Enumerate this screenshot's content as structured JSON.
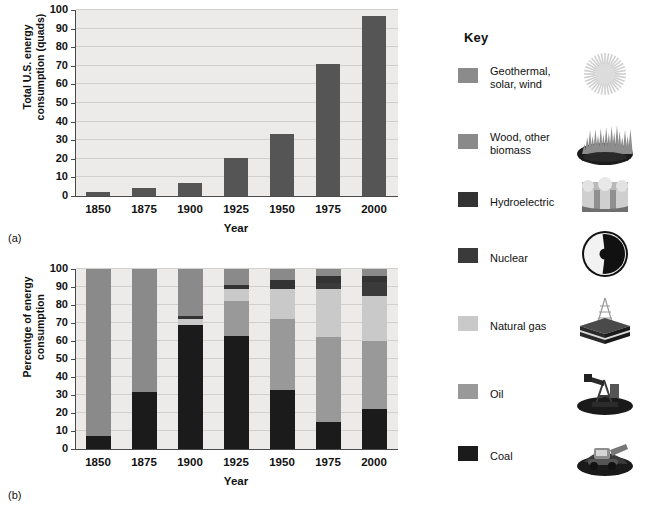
{
  "figure": {
    "panel_a_caption": "(a)",
    "panel_b_caption": "(b)"
  },
  "key": {
    "title": "Key",
    "items": [
      {
        "label": "Geothermal,\nsolar, wind",
        "color": "#8b8b8b",
        "icon": "sun-icon"
      },
      {
        "label": "Wood, other\nbiomass",
        "color": "#8a8a8a",
        "icon": "biomass-icon"
      },
      {
        "label": "Hydroelectric",
        "color": "#333333",
        "icon": "dam-icon"
      },
      {
        "label": "Nuclear",
        "color": "#3a3a3a",
        "icon": "radiation-icon"
      },
      {
        "label": "Natural gas",
        "color": "#c9c9c9",
        "icon": "gas-rig-icon"
      },
      {
        "label": "Oil",
        "color": "#999999",
        "icon": "oil-pump-icon"
      },
      {
        "label": "Coal",
        "color": "#1b1b1b",
        "icon": "coal-excavator-icon"
      }
    ]
  },
  "chart_data": [
    {
      "type": "bar",
      "panel": "a",
      "title": "",
      "xlabel": "Year",
      "ylabel": "Total U.S. energy\nconsumption (quads)",
      "categories": [
        "1850",
        "1875",
        "1900",
        "1925",
        "1950",
        "1975",
        "2000"
      ],
      "values": [
        2,
        4.5,
        7,
        20.5,
        33.5,
        71,
        97
      ],
      "ylim": [
        0,
        100
      ],
      "yticks": [
        0,
        10,
        20,
        30,
        40,
        50,
        60,
        70,
        80,
        90,
        100
      ],
      "bar_color": "#555555",
      "grid": true,
      "legend": "none"
    },
    {
      "type": "bar",
      "panel": "b",
      "stacked": true,
      "title": "",
      "xlabel": "Year",
      "ylabel": "Percentge of energy\nconsumption",
      "categories": [
        "1850",
        "1875",
        "1900",
        "1925",
        "1950",
        "1975",
        "2000"
      ],
      "ylim": [
        0,
        100
      ],
      "yticks": [
        0,
        10,
        20,
        30,
        40,
        50,
        60,
        70,
        80,
        90,
        100
      ],
      "grid": true,
      "legend": "Key (right side)",
      "series": [
        {
          "name": "Coal",
          "color": "#1b1b1b",
          "values": [
            7,
            31.5,
            69,
            63,
            33,
            15,
            22
          ]
        },
        {
          "name": "Oil",
          "color": "#999999",
          "values": [
            0,
            0,
            0,
            19,
            39,
            47,
            38
          ]
        },
        {
          "name": "Natural gas",
          "color": "#c9c9c9",
          "values": [
            0,
            0,
            3,
            7,
            17,
            27,
            25
          ]
        },
        {
          "name": "Nuclear",
          "color": "#3a3a3a",
          "values": [
            0,
            0,
            0,
            0,
            0,
            3,
            8
          ]
        },
        {
          "name": "Hydroelectric",
          "color": "#333333",
          "values": [
            0,
            0,
            2,
            2,
            5,
            4,
            3
          ]
        },
        {
          "name": "Wood, other biomass",
          "color": "#8a8a8a",
          "values": [
            93,
            68.5,
            26,
            9,
            6,
            2,
            3
          ]
        },
        {
          "name": "Geothermal, solar, wind",
          "color": "#8b8b8b",
          "values": [
            0,
            0,
            0,
            0,
            0,
            2,
            1
          ]
        }
      ]
    }
  ]
}
